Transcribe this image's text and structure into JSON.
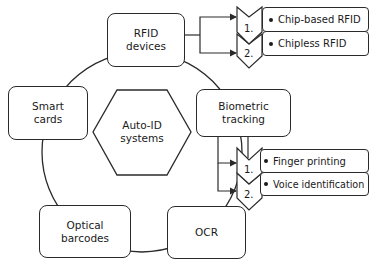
{
  "diagram": {
    "center": {
      "line1": "Auto-ID",
      "line2": "systems"
    },
    "nodes": [
      {
        "id": "rfid",
        "line1": "RFID",
        "line2": "devices"
      },
      {
        "id": "biometric",
        "line1": "Biometric",
        "line2": "tracking"
      },
      {
        "id": "ocr",
        "line1": "OCR"
      },
      {
        "id": "optical",
        "line1": "Optical",
        "line2": "barcodes"
      },
      {
        "id": "smart",
        "line1": "Smart",
        "line2": "cards"
      }
    ],
    "rfid_types": [
      {
        "num": "1.",
        "label": "Chip-based RFID"
      },
      {
        "num": "2.",
        "label": "Chipless RFID"
      }
    ],
    "biometric_types": [
      {
        "num": "1.",
        "label": "Finger printing"
      },
      {
        "num": "2.",
        "label": "Voice identification"
      }
    ]
  }
}
